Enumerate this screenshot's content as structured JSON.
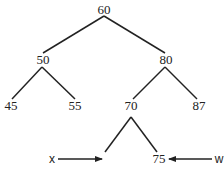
{
  "diagram": {
    "type": "binary-search-tree",
    "nodes": {
      "root": {
        "label": "60",
        "x": 104,
        "y": 14
      },
      "n50": {
        "label": "50",
        "x": 43,
        "y": 64
      },
      "n80": {
        "label": "80",
        "x": 166,
        "y": 64
      },
      "n45": {
        "label": "45",
        "x": 11,
        "y": 110
      },
      "n55": {
        "label": "55",
        "x": 75,
        "y": 110
      },
      "n70": {
        "label": "70",
        "x": 131,
        "y": 110
      },
      "n87": {
        "label": "87",
        "x": 199,
        "y": 110
      },
      "n75": {
        "label": "75",
        "x": 159,
        "y": 163
      }
    },
    "edges": [
      {
        "from": "60",
        "to": "50",
        "x1": 104,
        "y1": 16,
        "x2": 43,
        "y2": 53
      },
      {
        "from": "60",
        "to": "80",
        "x1": 104,
        "y1": 16,
        "x2": 165,
        "y2": 53
      },
      {
        "from": "50",
        "to": "45",
        "x1": 42,
        "y1": 67,
        "x2": 12,
        "y2": 99
      },
      {
        "from": "50",
        "to": "55",
        "x1": 42,
        "y1": 67,
        "x2": 75,
        "y2": 99
      },
      {
        "from": "80",
        "to": "70",
        "x1": 165,
        "y1": 67,
        "x2": 133,
        "y2": 99
      },
      {
        "from": "80",
        "to": "87",
        "x1": 165,
        "y1": 67,
        "x2": 197,
        "y2": 99
      },
      {
        "from": "70",
        "to": "x",
        "x1": 131,
        "y1": 117,
        "x2": 105,
        "y2": 152
      },
      {
        "from": "70",
        "to": "75",
        "x1": 131,
        "y1": 117,
        "x2": 157,
        "y2": 152
      }
    ],
    "pointers": {
      "x": {
        "label": "x",
        "text_x": 52,
        "text_y": 163,
        "arrow_x1": 58,
        "arrow_x2": 102,
        "arrow_y": 159
      },
      "w": {
        "label": "w",
        "text_x": 219,
        "text_y": 163,
        "arrow_x1": 212,
        "arrow_x2": 169,
        "arrow_y": 159
      }
    }
  }
}
